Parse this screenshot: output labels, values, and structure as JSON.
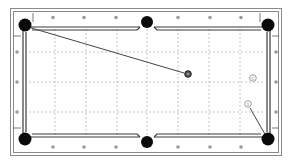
{
  "diagram": {
    "type": "pool-table-shot-diagram",
    "colors": {
      "background": "#ffffff",
      "frame": "#8a8a8a",
      "rail_line": "#3a3a3a",
      "pocket": "#0a0a0a",
      "diamond": "#9a9a9a",
      "grid": "#b8b8b8",
      "aim_line": "#444444",
      "ball_dark": "#555555",
      "ball_light": "#ffffff"
    },
    "pockets": [
      {
        "id": "top-left",
        "x": 25,
        "y": 25
      },
      {
        "id": "top-middle",
        "x": 147,
        "y": 22
      },
      {
        "id": "top-right",
        "x": 268,
        "y": 25
      },
      {
        "id": "bottom-left",
        "x": 25,
        "y": 139
      },
      {
        "id": "bottom-middle",
        "x": 147,
        "y": 142
      },
      {
        "id": "bottom-right",
        "x": 268,
        "y": 139
      }
    ],
    "balls": [
      {
        "id": "object-ball-dark",
        "label": "",
        "x": 188,
        "y": 74,
        "style": "dark"
      },
      {
        "id": "cue-ball",
        "label": "C",
        "x": 253,
        "y": 78,
        "style": "light"
      },
      {
        "id": "ball-1",
        "label": "1",
        "x": 248,
        "y": 104,
        "style": "light"
      }
    ],
    "lines": [
      {
        "id": "shot-line-dark-to-top-left",
        "x1": 184,
        "y1": 73,
        "x2": 28,
        "y2": 27
      },
      {
        "id": "shot-line-1-to-bottom-right",
        "x1": 250,
        "y1": 108,
        "x2": 266,
        "y2": 136
      }
    ]
  }
}
